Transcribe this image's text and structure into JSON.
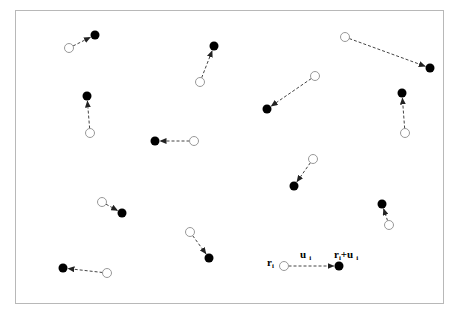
{
  "diagram": {
    "type": "displacement-field",
    "colors": {
      "frame": "#b8b8b8",
      "origin_stroke": "#999999",
      "target_fill": "#000000",
      "arrow": "#444444"
    },
    "displacements": [
      {
        "from": [
          69,
          48
        ],
        "to": [
          95,
          35
        ]
      },
      {
        "from": [
          200,
          82
        ],
        "to": [
          214,
          46
        ]
      },
      {
        "from": [
          345,
          37
        ],
        "to": [
          430,
          68
        ]
      },
      {
        "from": [
          90,
          133
        ],
        "to": [
          87,
          96
        ]
      },
      {
        "from": [
          315,
          76
        ],
        "to": [
          267,
          109
        ]
      },
      {
        "from": [
          405,
          133
        ],
        "to": [
          402,
          93
        ]
      },
      {
        "from": [
          194,
          141
        ],
        "to": [
          155,
          141
        ]
      },
      {
        "from": [
          313,
          159
        ],
        "to": [
          294,
          186
        ]
      },
      {
        "from": [
          102,
          202
        ],
        "to": [
          122,
          213
        ]
      },
      {
        "from": [
          389,
          225
        ],
        "to": [
          382,
          204
        ]
      },
      {
        "from": [
          190,
          232
        ],
        "to": [
          209,
          258
        ]
      },
      {
        "from": [
          107,
          273
        ],
        "to": [
          63,
          268
        ]
      },
      {
        "from": [
          284,
          266
        ],
        "to": [
          339,
          266
        ]
      }
    ],
    "legend": {
      "origin_label": "r",
      "origin_sub": "i",
      "vector_label": "u",
      "vector_sub": "i",
      "target_label_a": "r",
      "target_sub_a": "i",
      "target_plus": "+u",
      "target_sub_b": "i"
    }
  }
}
